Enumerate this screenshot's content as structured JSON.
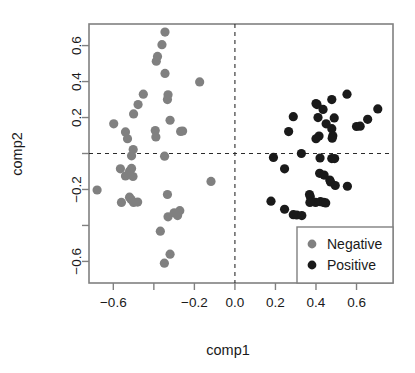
{
  "chart_data": {
    "type": "scatter",
    "title": "",
    "xlabel": "comp1",
    "ylabel": "comp2",
    "xlim": [
      -0.72,
      0.78
    ],
    "ylim": [
      -0.72,
      0.72
    ],
    "xticks": [
      -0.6,
      -0.4,
      -0.2,
      0.0,
      0.2,
      0.4,
      0.6
    ],
    "xtick_labels": [
      "−0.6",
      "",
      "−0.2",
      "0.0",
      "0.2",
      "0.4",
      "0.6"
    ],
    "yticks": [
      0.6,
      0.4,
      0.2,
      0.0,
      -0.2,
      -0.4,
      -0.6
    ],
    "ytick_labels": [
      "0.6",
      "0.4",
      "0.2",
      "",
      "−0.2",
      "",
      "−0.6"
    ],
    "grid": false,
    "reference_lines": {
      "vertical_x": 0.0,
      "horizontal_y": 0.0,
      "style": "dashed"
    },
    "legend": {
      "position": "bottom-right",
      "entries": [
        {
          "label": "Negative",
          "color": "#808080",
          "marker": "circle"
        },
        {
          "label": "Positive",
          "color": "#1a1a1a",
          "marker": "circle"
        }
      ]
    },
    "series": [
      {
        "name": "Negative",
        "color": "#808080",
        "marker": "circle",
        "marker_size": 4.6,
        "points": [
          [
            -0.345,
            0.675
          ],
          [
            -0.36,
            0.605
          ],
          [
            -0.382,
            0.54
          ],
          [
            -0.388,
            0.513
          ],
          [
            -0.345,
            0.445
          ],
          [
            -0.174,
            0.398
          ],
          [
            -0.452,
            0.33
          ],
          [
            -0.33,
            0.326
          ],
          [
            -0.333,
            0.3
          ],
          [
            -0.478,
            0.272
          ],
          [
            -0.5,
            0.22
          ],
          [
            -0.32,
            0.185
          ],
          [
            -0.598,
            0.165
          ],
          [
            -0.54,
            0.12
          ],
          [
            -0.393,
            0.128
          ],
          [
            -0.268,
            0.123
          ],
          [
            -0.258,
            0.125
          ],
          [
            -0.53,
            0.082
          ],
          [
            -0.39,
            0.092
          ],
          [
            -0.502,
            0.022
          ],
          [
            -0.51,
            -0.013
          ],
          [
            -0.347,
            -0.015
          ],
          [
            -0.565,
            -0.085
          ],
          [
            -0.51,
            -0.083
          ],
          [
            -0.52,
            -0.098
          ],
          [
            -0.54,
            -0.125
          ],
          [
            -0.503,
            -0.128
          ],
          [
            -0.118,
            -0.155
          ],
          [
            -0.68,
            -0.203
          ],
          [
            -0.52,
            -0.243
          ],
          [
            -0.512,
            -0.256
          ],
          [
            -0.333,
            -0.228
          ],
          [
            -0.56,
            -0.272
          ],
          [
            -0.5,
            -0.272
          ],
          [
            -0.48,
            -0.27
          ],
          [
            -0.3,
            -0.33
          ],
          [
            -0.272,
            -0.318
          ],
          [
            -0.283,
            -0.345
          ],
          [
            -0.33,
            -0.352
          ],
          [
            -0.368,
            -0.432
          ],
          [
            -0.32,
            -0.56
          ],
          [
            -0.348,
            -0.61
          ]
        ]
      },
      {
        "name": "Positive",
        "color": "#1a1a1a",
        "marker": "circle",
        "marker_size": 4.6,
        "points": [
          [
            0.553,
            0.33
          ],
          [
            0.478,
            0.3
          ],
          [
            0.4,
            0.278
          ],
          [
            0.405,
            0.272
          ],
          [
            0.435,
            0.245
          ],
          [
            0.705,
            0.248
          ],
          [
            0.288,
            0.205
          ],
          [
            0.41,
            0.2
          ],
          [
            0.49,
            0.198
          ],
          [
            0.655,
            0.19
          ],
          [
            0.45,
            0.165
          ],
          [
            0.6,
            0.15
          ],
          [
            0.618,
            0.152
          ],
          [
            0.478,
            0.138
          ],
          [
            0.265,
            0.122
          ],
          [
            0.415,
            0.097
          ],
          [
            0.483,
            0.098
          ],
          [
            0.48,
            0.085
          ],
          [
            0.4,
            0.082
          ],
          [
            0.328,
            0.0
          ],
          [
            0.19,
            -0.022
          ],
          [
            0.42,
            -0.025
          ],
          [
            0.478,
            -0.028
          ],
          [
            0.492,
            -0.028
          ],
          [
            0.245,
            -0.085
          ],
          [
            0.418,
            -0.11
          ],
          [
            0.44,
            -0.12
          ],
          [
            0.468,
            -0.148
          ],
          [
            0.472,
            -0.158
          ],
          [
            0.495,
            -0.178
          ],
          [
            0.555,
            -0.182
          ],
          [
            0.178,
            -0.265
          ],
          [
            0.368,
            -0.228
          ],
          [
            0.372,
            -0.24
          ],
          [
            0.398,
            -0.272
          ],
          [
            0.422,
            -0.268
          ],
          [
            0.438,
            -0.272
          ],
          [
            0.448,
            -0.275
          ],
          [
            0.37,
            -0.272
          ],
          [
            0.245,
            -0.31
          ],
          [
            0.288,
            -0.34
          ],
          [
            0.305,
            -0.342
          ],
          [
            0.33,
            -0.345
          ]
        ]
      }
    ]
  }
}
